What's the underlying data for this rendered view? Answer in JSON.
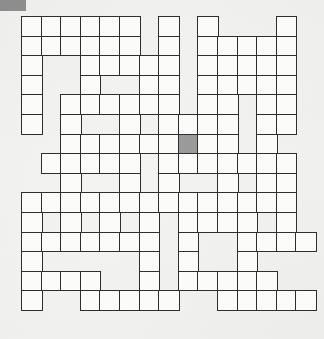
{
  "page": {
    "background_color": "#f3f3f1"
  },
  "corner_badge": {
    "name": "corner-badge",
    "label": "",
    "color": "#8d8d8d"
  },
  "grid": {
    "rows": 15,
    "cols": 15,
    "cell_size_px": 19.6,
    "origin_x_px": 21,
    "origin_y_px": 16,
    "cell_fill_color": "#fbfbfa",
    "cell_border_color": "#2e2e2e",
    "block_fill_color": "#9a9a9a",
    "legend": {
      "1": "open-cell",
      "0": "empty-space",
      "2": "shaded-cell"
    },
    "shaded_cells": [
      [
        6,
        8
      ]
    ],
    "layout": [
      [
        1,
        1,
        1,
        1,
        1,
        1,
        0,
        1,
        0,
        1,
        0,
        0,
        0,
        1,
        0
      ],
      [
        1,
        1,
        1,
        1,
        1,
        1,
        0,
        1,
        0,
        1,
        1,
        1,
        1,
        1,
        0
      ],
      [
        1,
        0,
        0,
        1,
        1,
        1,
        1,
        1,
        0,
        1,
        1,
        1,
        1,
        1,
        0
      ],
      [
        1,
        0,
        0,
        1,
        0,
        0,
        1,
        1,
        0,
        1,
        1,
        1,
        1,
        1,
        0
      ],
      [
        1,
        0,
        1,
        1,
        1,
        1,
        1,
        1,
        0,
        1,
        1,
        0,
        1,
        1,
        0
      ],
      [
        1,
        0,
        1,
        0,
        0,
        1,
        0,
        1,
        1,
        1,
        1,
        0,
        1,
        1,
        0
      ],
      [
        0,
        0,
        1,
        1,
        1,
        1,
        1,
        1,
        2,
        1,
        1,
        0,
        1,
        0,
        0
      ],
      [
        0,
        1,
        1,
        1,
        1,
        1,
        0,
        1,
        1,
        1,
        1,
        1,
        1,
        1,
        0
      ],
      [
        0,
        0,
        1,
        0,
        0,
        1,
        0,
        1,
        0,
        0,
        1,
        0,
        1,
        1,
        0
      ],
      [
        1,
        1,
        1,
        1,
        1,
        1,
        1,
        1,
        1,
        1,
        1,
        1,
        1,
        1,
        0
      ],
      [
        1,
        0,
        1,
        0,
        1,
        0,
        1,
        0,
        1,
        1,
        1,
        1,
        0,
        1,
        0
      ],
      [
        1,
        1,
        1,
        1,
        1,
        1,
        1,
        0,
        1,
        0,
        0,
        1,
        1,
        1,
        1
      ],
      [
        1,
        0,
        0,
        0,
        0,
        0,
        1,
        0,
        1,
        0,
        0,
        1,
        0,
        0,
        0
      ],
      [
        1,
        1,
        1,
        1,
        0,
        0,
        1,
        0,
        1,
        1,
        1,
        1,
        1,
        0,
        0
      ],
      [
        1,
        0,
        0,
        1,
        1,
        1,
        1,
        1,
        0,
        0,
        1,
        1,
        1,
        1,
        1
      ]
    ]
  }
}
